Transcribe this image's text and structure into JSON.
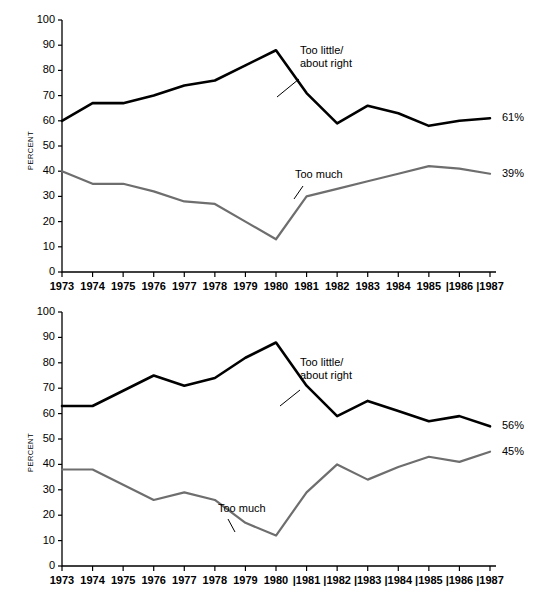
{
  "charts": [
    {
      "id": "top",
      "ylabel": "PERCENT",
      "yticks": [
        "0",
        "10",
        "20",
        "30",
        "40",
        "50",
        "60",
        "70",
        "80",
        "90",
        "100"
      ],
      "xticks": [
        "1973",
        "1974",
        "1975",
        "1976",
        "1977",
        "1978",
        "1979",
        "1980",
        "1981",
        "1982",
        "1983",
        "1984",
        "1985",
        "|1986",
        "|1987"
      ],
      "annotation_high": "Too little/\nabout right",
      "annotation_high_line1": "Too little/",
      "annotation_high_line2": "about right",
      "annotation_low": "Too much",
      "endlabel_high": "61%",
      "endlabel_low": "39%",
      "chart_data": {
        "type": "line",
        "title": "",
        "xlabel": "",
        "ylabel": "PERCENT",
        "ylim": [
          0,
          100
        ],
        "grid": false,
        "legend": "inline-annotations",
        "x": [
          "1973",
          "1974",
          "1975",
          "1976",
          "1977",
          "1978",
          "1979",
          "1980",
          "1981",
          "1982",
          "1983",
          "1984",
          "1985",
          "1986",
          "1987"
        ],
        "series": [
          {
            "name": "Too little/about right",
            "color": "#000000",
            "end_label": "61%",
            "values": [
              60,
              67,
              67,
              70,
              74,
              76,
              82,
              88,
              71,
              59,
              66,
              63,
              58,
              60,
              61
            ]
          },
          {
            "name": "Too much",
            "color": "#6e6e6e",
            "end_label": "39%",
            "values": [
              40,
              35,
              35,
              32,
              28,
              27,
              20,
              13,
              30,
              33,
              36,
              39,
              42,
              41,
              39
            ]
          }
        ]
      }
    },
    {
      "id": "bottom",
      "ylabel": "PERCENT",
      "yticks": [
        "0",
        "10",
        "20",
        "30",
        "40",
        "50",
        "60",
        "70",
        "80",
        "90",
        "100"
      ],
      "xticks": [
        "1973",
        "1974",
        "1975",
        "1976",
        "1977",
        "1978",
        "1979",
        "1980",
        "|1981",
        "|1982",
        "|1983",
        "|1984",
        "|1985",
        "|1986",
        "|1987"
      ],
      "annotation_high_line1": "Too little/",
      "annotation_high_line2": "about right",
      "annotation_low": "Too much",
      "endlabel_high": "56%",
      "endlabel_low": "45%",
      "chart_data": {
        "type": "line",
        "title": "",
        "xlabel": "",
        "ylabel": "PERCENT",
        "ylim": [
          0,
          100
        ],
        "grid": false,
        "legend": "inline-annotations",
        "x": [
          "1973",
          "1974",
          "1975",
          "1976",
          "1977",
          "1978",
          "1979",
          "1980",
          "1981",
          "1982",
          "1983",
          "1984",
          "1985",
          "1986",
          "1987"
        ],
        "series": [
          {
            "name": "Too little/about right",
            "color": "#000000",
            "end_label": "56%",
            "values": [
              63,
              63,
              69,
              75,
              71,
              74,
              82,
              88,
              71,
              59,
              65,
              61,
              57,
              59,
              55
            ]
          },
          {
            "name": "Too much",
            "color": "#6e6e6e",
            "end_label": "45%",
            "values": [
              38,
              38,
              32,
              26,
              29,
              26,
              17,
              12,
              29,
              40,
              34,
              39,
              43,
              41,
              45
            ]
          }
        ]
      }
    }
  ]
}
